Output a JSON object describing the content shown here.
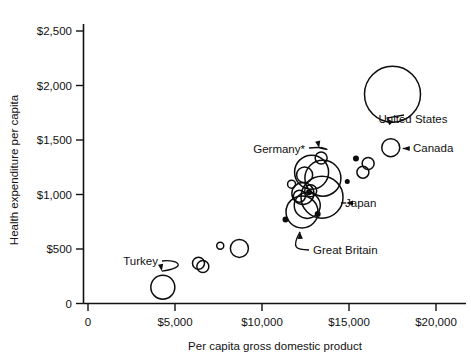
{
  "chart_data": {
    "type": "scatter",
    "title": "",
    "xlabel": "Per capita gross domestic product",
    "ylabel": "Health expenditure per capita",
    "xlim": [
      0,
      21000
    ],
    "ylim": [
      0,
      2600
    ],
    "grid": false,
    "legend": "none",
    "note": "Bubble area encodes a third variable; bubbles drawn as open circles",
    "xticks": [
      {
        "value": 0,
        "label": "0"
      },
      {
        "value": 5000,
        "label": "$5,000"
      },
      {
        "value": 10000,
        "label": "$10,000"
      },
      {
        "value": 15000,
        "label": "$15,000"
      },
      {
        "value": 20000,
        "label": "$20,000"
      }
    ],
    "yticks": [
      {
        "value": 0,
        "label": "0"
      },
      {
        "value": 500,
        "label": "$500"
      },
      {
        "value": 1000,
        "label": "$1,000"
      },
      {
        "value": 1500,
        "label": "$1,500"
      },
      {
        "value": 2000,
        "label": "$2,000"
      },
      {
        "value": 2500,
        "label": "$2,500"
      }
    ],
    "points": [
      {
        "name": "united-states",
        "x": 17500,
        "y": 1920,
        "r": 28
      },
      {
        "name": "canada",
        "x": 17400,
        "y": 1430,
        "r": 9
      },
      {
        "name": "unlabeled-a",
        "x": 15400,
        "y": 1330,
        "r": 3
      },
      {
        "name": "unlabeled-b",
        "x": 16100,
        "y": 1285,
        "r": 6
      },
      {
        "name": "unlabeled-c",
        "x": 15800,
        "y": 1205,
        "r": 6
      },
      {
        "name": "unlabeled-d",
        "x": 14900,
        "y": 1120,
        "r": 2.5
      },
      {
        "name": "germany",
        "x": 13400,
        "y": 1335,
        "r": 6
      },
      {
        "name": "cluster-upper-left",
        "x": 12450,
        "y": 1180,
        "r": 8
      },
      {
        "name": "cluster-upper-mid",
        "x": 12850,
        "y": 1205,
        "r": 17
      },
      {
        "name": "cluster-upper-right",
        "x": 13500,
        "y": 1150,
        "r": 18
      },
      {
        "name": "cluster-small-left",
        "x": 11700,
        "y": 1095,
        "r": 4
      },
      {
        "name": "japan",
        "x": 13450,
        "y": 975,
        "r": 21
      },
      {
        "name": "cluster-mid-a",
        "x": 12350,
        "y": 1010,
        "r": 11
      },
      {
        "name": "cluster-mid-b",
        "x": 12150,
        "y": 985,
        "r": 6
      },
      {
        "name": "cluster-mid-c",
        "x": 12800,
        "y": 1035,
        "r": 6
      },
      {
        "name": "cluster-mid-d",
        "x": 12700,
        "y": 1020,
        "r": 3
      },
      {
        "name": "great-britain",
        "x": 12300,
        "y": 840,
        "r": 16
      },
      {
        "name": "cluster-low-b",
        "x": 12600,
        "y": 900,
        "r": 13
      },
      {
        "name": "cluster-low-dot",
        "x": 13200,
        "y": 820,
        "r": 3
      },
      {
        "name": "unlabeled-e",
        "x": 11350,
        "y": 770,
        "r": 3
      },
      {
        "name": "unlabeled-f",
        "x": 8700,
        "y": 505,
        "r": 9
      },
      {
        "name": "unlabeled-g",
        "x": 7600,
        "y": 530,
        "r": 3.5
      },
      {
        "name": "unlabeled-h",
        "x": 6350,
        "y": 370,
        "r": 6
      },
      {
        "name": "unlabeled-i",
        "x": 6600,
        "y": 340,
        "r": 6
      },
      {
        "name": "turkey",
        "x": 4300,
        "y": 150,
        "r": 12
      }
    ],
    "annotations": [
      {
        "name": "united-states",
        "label": "United States",
        "anchor": "middle",
        "tx": 413,
        "ty": 123
      },
      {
        "name": "canada",
        "label": "Canada",
        "anchor": "start",
        "tx": 413,
        "ty": 152
      },
      {
        "name": "germany",
        "label": "Germany*",
        "anchor": "end",
        "tx": 305,
        "ty": 153
      },
      {
        "name": "japan",
        "label": "Japan",
        "anchor": "start",
        "tx": 345,
        "ty": 207
      },
      {
        "name": "great-britain",
        "label": "Great Britain",
        "anchor": "start",
        "tx": 313,
        "ty": 254
      },
      {
        "name": "turkey",
        "label": "Turkey",
        "anchor": "end",
        "tx": 158,
        "ty": 265
      }
    ]
  }
}
